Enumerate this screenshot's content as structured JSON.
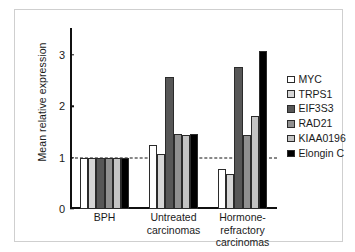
{
  "chart_data": {
    "type": "bar",
    "title": "",
    "xlabel": "",
    "ylabel": "Mean relative expression",
    "categories": [
      "BPH",
      "Untreated carcinomas",
      "Hormone-refractory carcinomas"
    ],
    "category_lines": [
      [
        "BPH"
      ],
      [
        "Untreated",
        "carcinomas"
      ],
      [
        "Hormone-refractory",
        "carcinomas"
      ]
    ],
    "ylim": [
      0,
      3.45
    ],
    "yticks": [
      0,
      1,
      2,
      3
    ],
    "ytick_labels": [
      "0",
      "1",
      "2",
      "3"
    ],
    "grid": false,
    "reference_line": 1,
    "legend_position": "right",
    "series": [
      {
        "name": "MYC",
        "color": "#ffffff",
        "values": [
          1.0,
          1.25,
          0.78
        ]
      },
      {
        "name": "TRPS1",
        "color": "#d6d6d6",
        "values": [
          1.0,
          1.08,
          0.68
        ]
      },
      {
        "name": "EIF3S3",
        "color": "#575757",
        "values": [
          1.0,
          2.57,
          2.77
        ]
      },
      {
        "name": "RAD21",
        "color": "#909090",
        "values": [
          1.0,
          1.46,
          1.45
        ]
      },
      {
        "name": "KIAA0196",
        "color": "#c4c4c4",
        "values": [
          1.0,
          1.45,
          1.82
        ]
      },
      {
        "name": "Elongin C",
        "color": "#000000",
        "values": [
          1.0,
          1.46,
          3.08
        ]
      }
    ]
  },
  "colors": {
    "axis": "#111111",
    "bar_outline": "#2b2b2b",
    "frame": "#cfcfcf",
    "background": "#ffffff"
  }
}
